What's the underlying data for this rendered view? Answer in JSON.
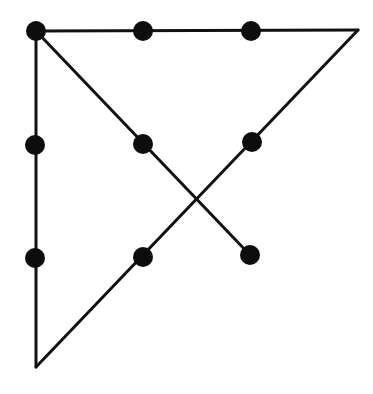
{
  "diagram": {
    "title": "Nine-dot puzzle solution",
    "stroke_color": "#111111",
    "dot_color": "#0d0d0d",
    "background": "#ffffff",
    "stroke_width": 3,
    "dot_radius": 10,
    "dots": [
      {
        "id": "r1c1",
        "cx": 36,
        "cy": 31
      },
      {
        "id": "r1c2",
        "cx": 143,
        "cy": 31
      },
      {
        "id": "r1c3",
        "cx": 251,
        "cy": 31
      },
      {
        "id": "r2c1",
        "cx": 35,
        "cy": 145
      },
      {
        "id": "r2c2",
        "cx": 143,
        "cy": 144
      },
      {
        "id": "r2c3",
        "cx": 252,
        "cy": 142
      },
      {
        "id": "r3c1",
        "cx": 35,
        "cy": 258
      },
      {
        "id": "r3c2",
        "cx": 143,
        "cy": 257
      },
      {
        "id": "r3c3",
        "cx": 250,
        "cy": 255
      }
    ],
    "lines": [
      {
        "id": "line-1-top",
        "x1": 36,
        "y1": 31,
        "x2": 358,
        "y2": 30
      },
      {
        "id": "line-2-diagonal-down-left",
        "x1": 358,
        "y1": 30,
        "x2": 36,
        "y2": 367
      },
      {
        "id": "line-3-left-vertical",
        "x1": 36,
        "y1": 367,
        "x2": 36,
        "y2": 31
      },
      {
        "id": "line-4-diagonal-down-right",
        "x1": 36,
        "y1": 31,
        "x2": 250,
        "y2": 255
      }
    ]
  }
}
